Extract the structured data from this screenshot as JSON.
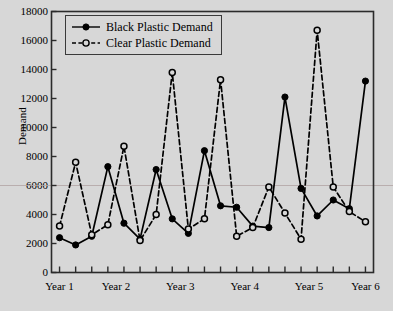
{
  "chart_data": {
    "type": "line",
    "title": "",
    "xlabel": "",
    "ylabel": "Demand",
    "ylim": [
      0,
      18000
    ],
    "ytick_values": [
      0,
      2000,
      4000,
      6000,
      8000,
      10000,
      12000,
      14000,
      16000,
      18000
    ],
    "ytick_labels": [
      "0",
      "2000",
      "4000",
      "6000",
      "8000",
      "10000",
      "12000",
      "14000",
      "16000",
      "18000"
    ],
    "xtick_labels": [
      "Year 1",
      "Year 2",
      "Year 3",
      "Year 4",
      "Year 5",
      "Year 6"
    ],
    "x_minor_ticks": 20,
    "grid": false,
    "legend_position": "top-left",
    "x": [
      1,
      2,
      3,
      4,
      5,
      6,
      7,
      8,
      9,
      10,
      11,
      12,
      13,
      14,
      15,
      16,
      17,
      18,
      19,
      20
    ],
    "series": [
      {
        "name": "Black Plastic Demand",
        "color": "#000000",
        "linestyle": "solid",
        "marker": "filled-circle",
        "values": [
          2400,
          1900,
          2500,
          7300,
          3400,
          2300,
          7100,
          3700,
          2700,
          8400,
          4600,
          4500,
          3200,
          3100,
          12100,
          5800,
          3900,
          5000,
          4400,
          13200
        ]
      },
      {
        "name": "Clear Plastic Demand",
        "color": "#000000",
        "linestyle": "dashed",
        "marker": "open-circle",
        "values": [
          3200,
          7600,
          2600,
          3300,
          8700,
          2200,
          4000,
          13800,
          3000,
          3700,
          13300,
          2500,
          3100,
          5900,
          4100,
          2300,
          16700,
          5900,
          4200,
          3500
        ]
      }
    ]
  },
  "legend": {
    "items": [
      {
        "label": "Black Plastic Demand",
        "marker": "filled-circle",
        "linestyle": "solid"
      },
      {
        "label": "Clear Plastic Demand",
        "marker": "open-circle",
        "linestyle": "dashed"
      }
    ]
  },
  "colors": {
    "background": "#d7d7d7",
    "axis": "#2b2b2b",
    "series": "#000000",
    "gridline": "#b4a8a8"
  }
}
